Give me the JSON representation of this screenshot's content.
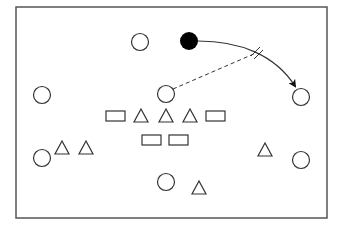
{
  "diagram": {
    "type": "play-diagram",
    "frame": {
      "x": 16,
      "y": 7,
      "width": 311,
      "height": 211,
      "stroke": "#555555"
    },
    "colors": {
      "stroke": "#333333",
      "fill_player": "#000000",
      "background": "#ffffff"
    },
    "open_circles": [
      {
        "id": "c-top",
        "cx": 140,
        "cy": 42
      },
      {
        "id": "c-left-upper",
        "cx": 42,
        "cy": 95
      },
      {
        "id": "c-center",
        "cx": 166,
        "cy": 94
      },
      {
        "id": "c-right-upper",
        "cx": 301,
        "cy": 97
      },
      {
        "id": "c-left-lower",
        "cx": 42,
        "cy": 158
      },
      {
        "id": "c-right-lower",
        "cx": 301,
        "cy": 160
      },
      {
        "id": "c-bottom",
        "cx": 166,
        "cy": 182
      }
    ],
    "filled_circle": {
      "id": "ball-carrier",
      "cx": 189,
      "cy": 41
    },
    "rectangles": [
      {
        "id": "r1",
        "x": 106,
        "y": 111,
        "w": 19,
        "h": 10
      },
      {
        "id": "r2",
        "x": 206,
        "y": 111,
        "w": 19,
        "h": 10
      },
      {
        "id": "r3",
        "x": 142,
        "y": 135,
        "w": 19,
        "h": 10
      },
      {
        "id": "r4",
        "x": 169,
        "y": 135,
        "w": 19,
        "h": 10
      }
    ],
    "triangles": [
      {
        "id": "t1",
        "cx": 141,
        "cy": 116
      },
      {
        "id": "t2",
        "cx": 166,
        "cy": 116
      },
      {
        "id": "t3",
        "cx": 190,
        "cy": 116
      },
      {
        "id": "t4",
        "cx": 62,
        "cy": 148
      },
      {
        "id": "t5",
        "cx": 86,
        "cy": 148
      },
      {
        "id": "t6",
        "cx": 265,
        "cy": 150
      },
      {
        "id": "t7",
        "cx": 199,
        "cy": 188
      }
    ],
    "pass_arrow": {
      "path": "M198,41 C240,41 275,55 295,86",
      "label": "curved pass path"
    },
    "dashed_line": {
      "x1": 173,
      "y1": 89,
      "x2": 256,
      "y2": 53
    },
    "intercept_mark": {
      "cx": 257,
      "cy": 53
    }
  }
}
